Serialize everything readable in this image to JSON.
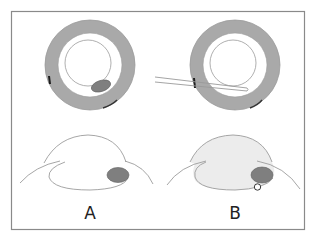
{
  "figure": {
    "panels": [
      {
        "id": "A",
        "label": "A",
        "profile_fill": "#ffffff",
        "has_instrument": false,
        "has_small_circle": false
      },
      {
        "id": "B",
        "label": "B",
        "profile_fill": "#ececec",
        "has_instrument": true,
        "has_small_circle": true
      }
    ],
    "colors": {
      "frame": "#8a8a8a",
      "ring": "#a9a9a9",
      "ring_edge": "#9a9a9a",
      "inner_circle": "#9a9a9a",
      "lesion": "#7f7f7f",
      "lesion_edge": "#5e5e5e",
      "mark": "#1e1e1e",
      "outline": "#9c9c9c"
    }
  }
}
